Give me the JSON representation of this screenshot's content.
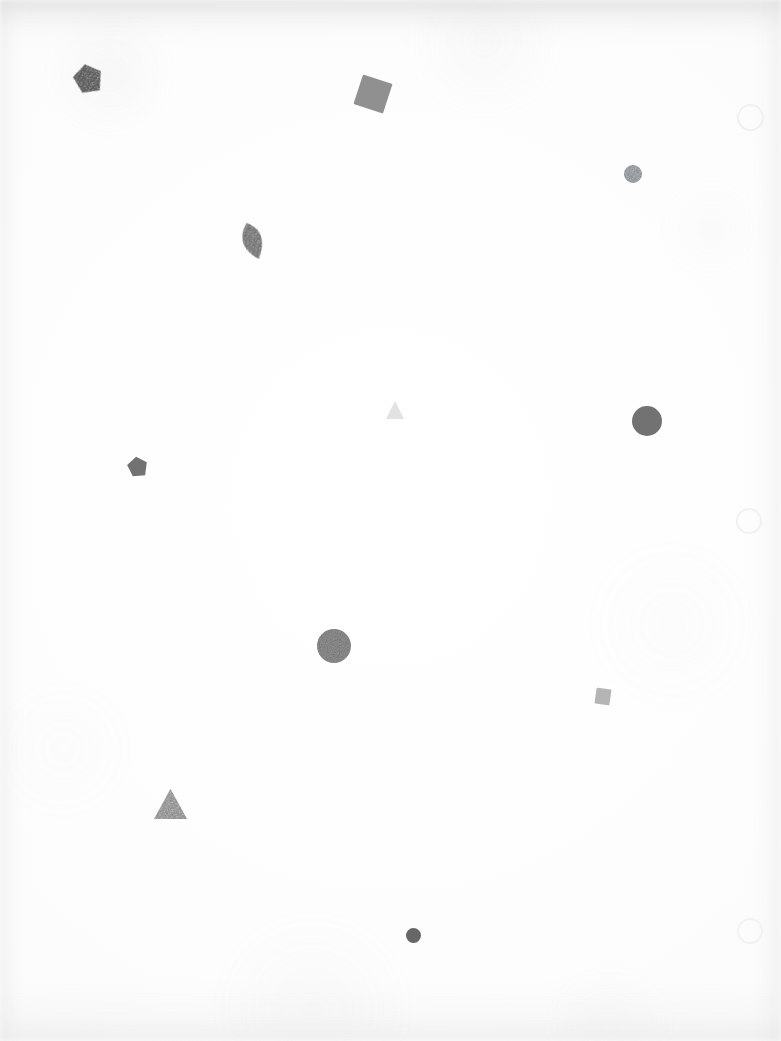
{
  "scene": {
    "title": "Scattered Geometric Shapes",
    "width": 781,
    "height": 1041,
    "background_color": "#fdfdfd",
    "paper_edge_color": "#c8c8ca",
    "description": "Sparse abstract composition of small grey geometric shapes on an off-white paper ground"
  },
  "palette": {
    "dark_gray": "#5a5a5a",
    "medium_gray": "#6e6e6e",
    "mid_gray": "#7b7b7b",
    "light_gray": "#8f8f8f",
    "pale_gray": "#bdbdbd",
    "very_pale_gray": "#e8e8e8",
    "ghost_outline": "#f1f1f1",
    "slate_blue_gray": "#8a9098"
  },
  "shapes": [
    {
      "id": "pentagon-top-left",
      "name": "pentagon",
      "label": "Dark pentagon",
      "x": 73,
      "y": 63,
      "width": 30,
      "height": 32,
      "rotation": -12,
      "fill": "#555555",
      "opacity": 0.92,
      "texture": "speckled"
    },
    {
      "id": "square-top-center",
      "name": "square",
      "label": "Rotated grey square",
      "x": 357,
      "y": 78,
      "width": 32,
      "height": 32,
      "rotation": 18,
      "fill": "#8a8a8a",
      "opacity": 0.95,
      "texture": "flat"
    },
    {
      "id": "circle-ghost-top-right",
      "name": "circle-outline",
      "label": "Faint circle outline",
      "x": 737,
      "y": 104,
      "width": 27,
      "height": 27,
      "rotation": 0,
      "fill": "none",
      "stroke": "#f0f0f0",
      "opacity": 1,
      "texture": "outline"
    },
    {
      "id": "circle-small-upper-right",
      "name": "circle",
      "label": "Small slate circle",
      "x": 624,
      "y": 165,
      "width": 18,
      "height": 18,
      "rotation": 0,
      "fill": "#8d939a",
      "opacity": 0.9,
      "texture": "speckled"
    },
    {
      "id": "leaf-upper-left",
      "name": "leaf",
      "label": "Leaf / lens shape",
      "x": 240,
      "y": 222,
      "width": 25,
      "height": 38,
      "rotation": -18,
      "fill": "#767676",
      "opacity": 0.95,
      "texture": "speckled"
    },
    {
      "id": "triangle-pale-center",
      "name": "triangle",
      "label": "Very pale triangle",
      "x": 386,
      "y": 401,
      "width": 18,
      "height": 18,
      "rotation": 0,
      "fill": "#e2e2e2",
      "opacity": 1,
      "texture": "flat"
    },
    {
      "id": "circle-large-right",
      "name": "circle",
      "label": "Large grey circle",
      "x": 632,
      "y": 406,
      "width": 30,
      "height": 30,
      "rotation": 0,
      "fill": "#6b6b6b",
      "opacity": 0.95,
      "texture": "flat"
    },
    {
      "id": "pentagon-mid-left",
      "name": "pentagon",
      "label": "Small grey pentagon",
      "x": 127,
      "y": 456,
      "width": 21,
      "height": 22,
      "rotation": -8,
      "fill": "#6a6a6a",
      "opacity": 0.95,
      "texture": "flat"
    },
    {
      "id": "circle-ghost-mid-right",
      "name": "circle-outline",
      "label": "Faint circle outline",
      "x": 736,
      "y": 508,
      "width": 26,
      "height": 26,
      "rotation": 0,
      "fill": "none",
      "stroke": "#f1f1f1",
      "opacity": 1,
      "texture": "outline"
    },
    {
      "id": "circle-noisy-center",
      "name": "circle",
      "label": "Noisy textured circle",
      "x": 317,
      "y": 629,
      "width": 34,
      "height": 34,
      "rotation": 0,
      "fill": "#909090",
      "opacity": 0.95,
      "texture": "noise"
    },
    {
      "id": "square-small-right",
      "name": "square",
      "label": "Small pale square",
      "x": 595,
      "y": 688,
      "width": 16,
      "height": 17,
      "rotation": 8,
      "fill": "#adadad",
      "opacity": 0.9,
      "texture": "flat"
    },
    {
      "id": "triangle-lower-left",
      "name": "triangle",
      "label": "Grey triangle",
      "x": 154,
      "y": 789,
      "width": 33,
      "height": 30,
      "rotation": 0,
      "fill": "#959595",
      "opacity": 0.95,
      "texture": "speckled"
    },
    {
      "id": "circle-ghost-bottom-right",
      "name": "circle-outline",
      "label": "Faint circle outline",
      "x": 737,
      "y": 918,
      "width": 26,
      "height": 26,
      "rotation": 0,
      "fill": "none",
      "stroke": "#f2f2f2",
      "opacity": 1,
      "texture": "outline"
    },
    {
      "id": "dot-bottom-center",
      "name": "circle",
      "label": "Small dark dot",
      "x": 406,
      "y": 928,
      "width": 15,
      "height": 15,
      "rotation": 0,
      "fill": "#5f5f5f",
      "opacity": 0.95,
      "texture": "flat"
    }
  ]
}
